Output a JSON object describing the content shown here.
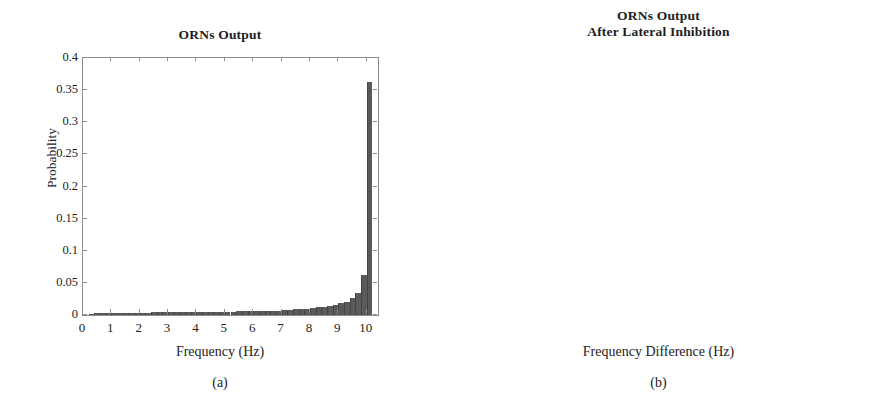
{
  "figure": {
    "panels": [
      {
        "id": "a",
        "caption": "(a)",
        "title": "ORNs Output",
        "xlabel": "Frequency (Hz)",
        "ylabel": "Probability"
      },
      {
        "id": "b",
        "caption": "(b)",
        "title_line1": "ORNs Output",
        "title_line2": "After Lateral Inhibition",
        "xlabel": "Frequency Difference (Hz)",
        "ylabel": "Probability"
      }
    ]
  },
  "chart_data": [
    {
      "type": "bar",
      "panel": "a",
      "title": "ORNs Output",
      "xlabel": "Frequency (Hz)",
      "ylabel": "Probability",
      "xlim": [
        0,
        10.4
      ],
      "ylim": [
        0,
        0.4
      ],
      "xticks": [
        0,
        1,
        2,
        3,
        4,
        5,
        6,
        7,
        8,
        9,
        10
      ],
      "xtick_labels": [
        "0",
        "1",
        "2",
        "3",
        "4",
        "5",
        "6",
        "7",
        "8",
        "9",
        "10"
      ],
      "yticks": [
        0,
        0.05,
        0.1,
        0.15,
        0.2,
        0.25,
        0.3,
        0.35,
        0.4
      ],
      "ytick_labels": [
        "0",
        "0.05",
        "0.1",
        "0.15",
        "0.2",
        "0.25",
        "0.3",
        "0.35",
        "0.4"
      ],
      "grid": false,
      "legend": null,
      "bar_color": "#5a5a5a",
      "bin_width": 0.2,
      "x": [
        0.3,
        0.5,
        0.7,
        0.9,
        1.1,
        1.3,
        1.5,
        1.7,
        1.9,
        2.1,
        2.3,
        2.5,
        2.7,
        2.9,
        3.1,
        3.3,
        3.5,
        3.7,
        3.9,
        4.1,
        4.3,
        4.5,
        4.7,
        4.9,
        5.1,
        5.3,
        5.5,
        5.7,
        5.9,
        6.1,
        6.3,
        6.5,
        6.7,
        6.9,
        7.1,
        7.3,
        7.5,
        7.7,
        7.9,
        8.1,
        8.3,
        8.5,
        8.7,
        8.9,
        9.1,
        9.3,
        9.5,
        9.7,
        9.9,
        10.1
      ],
      "values": [
        0.002,
        0.003,
        0.003,
        0.003,
        0.003,
        0.003,
        0.003,
        0.003,
        0.003,
        0.003,
        0.003,
        0.004,
        0.004,
        0.004,
        0.004,
        0.004,
        0.004,
        0.004,
        0.004,
        0.005,
        0.005,
        0.005,
        0.005,
        0.005,
        0.005,
        0.005,
        0.006,
        0.006,
        0.006,
        0.006,
        0.006,
        0.007,
        0.007,
        0.007,
        0.008,
        0.008,
        0.009,
        0.009,
        0.01,
        0.011,
        0.012,
        0.013,
        0.014,
        0.016,
        0.018,
        0.021,
        0.026,
        0.034,
        0.063,
        0.362
      ]
    },
    {
      "type": "bar",
      "panel": "b",
      "title": "ORNs Output After Lateral Inhibition",
      "xlabel": "Frequency Difference (Hz)",
      "ylabel": "Probability",
      "xlim": [
        0,
        7
      ],
      "ylim": [
        0,
        0.045
      ],
      "xticks": [
        0,
        1,
        2,
        3,
        4,
        5,
        6,
        7
      ],
      "xtick_labels": [
        "0",
        "1",
        "2",
        "3",
        "4",
        "5",
        "6",
        "7"
      ],
      "yticks": [
        0,
        0.005,
        0.01,
        0.015,
        0.02,
        0.025,
        0.03,
        0.035,
        0.04,
        0.045
      ],
      "ytick_labels": [
        "0",
        "0.005",
        "0.01",
        "0.015",
        "0.02",
        "0.025",
        "0.03",
        "0.035",
        "0.04",
        "0.045"
      ],
      "grid": false,
      "legend": null,
      "bar_color": "#5a5a5a",
      "bin_width": 0.1,
      "x": [
        0.15,
        0.25,
        0.35,
        0.45,
        0.55,
        0.65,
        0.75,
        0.85,
        0.95,
        1.05,
        1.15,
        1.25,
        1.35,
        1.45,
        1.55,
        1.65,
        1.75,
        1.85,
        1.95,
        2.05,
        2.15,
        2.25,
        2.35,
        2.45,
        2.55,
        2.65,
        2.75,
        2.85,
        2.95,
        3.05,
        3.15,
        3.25,
        3.35,
        3.45,
        3.55,
        3.65,
        3.75,
        3.85,
        3.95,
        4.05,
        4.15,
        4.25,
        4.35,
        4.45,
        4.55,
        4.65,
        4.75,
        4.85,
        4.95,
        5.05,
        5.15,
        5.25,
        5.35,
        5.45,
        5.55,
        5.65,
        5.75,
        5.85,
        5.95,
        6.05,
        6.15,
        6.25,
        6.35,
        6.45,
        6.55,
        6.65
      ],
      "values": [
        0.0077,
        0.011,
        0.0122,
        0.015,
        0.0163,
        0.0164,
        0.0134,
        0.0098,
        0.0153,
        0.0131,
        0.0112,
        0.0112,
        0.0172,
        0.011,
        0.011,
        0.0146,
        0.0146,
        0.0157,
        0.0152,
        0.029,
        0.041,
        0.0404,
        0.0385,
        0.0373,
        0.0355,
        0.033,
        0.0328,
        0.0323,
        0.0319,
        0.0306,
        0.0295,
        0.029,
        0.0283,
        0.0272,
        0.0265,
        0.0259,
        0.025,
        0.0239,
        0.0237,
        0.0233,
        0.0231,
        0.0228,
        0.0221,
        0.0213,
        0.0208,
        0.0203,
        0.0197,
        0.0194,
        0.0187,
        0.0183,
        0.018,
        0.0174,
        0.0166,
        0.0163,
        0.0158,
        0.015,
        0.0146,
        0.014,
        0.0131,
        0.0123,
        0.0118,
        0.0112,
        0.0103,
        0.009,
        0.0073,
        0.0047
      ]
    }
  ]
}
